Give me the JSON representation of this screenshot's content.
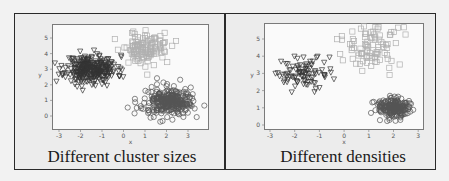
{
  "figure": {
    "panels": [
      {
        "caption": "Different cluster sizes",
        "xlabel": "x",
        "ylabel": "y"
      },
      {
        "caption": "Different densities",
        "xlabel": "x",
        "ylabel": "y"
      }
    ]
  },
  "chart_data": [
    {
      "type": "scatter",
      "title": "Different cluster sizes",
      "xlabel": "x",
      "ylabel": "y",
      "xlim": [
        -3.3,
        3.9
      ],
      "ylim": [
        -0.5,
        5.7
      ],
      "xticks": [
        -3,
        -2,
        -1,
        0,
        1,
        2,
        3
      ],
      "yticks": [
        0,
        1,
        2,
        3,
        4,
        5
      ],
      "grid": false,
      "legend": null,
      "series": [
        {
          "name": "cluster-triangles",
          "marker": "triangle-down",
          "color": "#333333",
          "center": [
            -1.5,
            3.0
          ],
          "spread": [
            0.6,
            0.45
          ],
          "count": 300,
          "note": "large dense cluster"
        },
        {
          "name": "cluster-squares",
          "marker": "square",
          "color": "#b0b0b0",
          "center": [
            1.0,
            4.4
          ],
          "spread": [
            0.55,
            0.5
          ],
          "count": 120
        },
        {
          "name": "cluster-circles",
          "marker": "circle",
          "color": "#555555",
          "center": [
            2.1,
            0.9
          ],
          "spread": [
            0.55,
            0.45
          ],
          "count": 300
        }
      ]
    },
    {
      "type": "scatter",
      "title": "Different densities",
      "xlabel": "x",
      "ylabel": "y",
      "xlim": [
        -3.2,
        3.2
      ],
      "ylim": [
        -0.3,
        5.8
      ],
      "xticks": [
        -3,
        -2,
        -1,
        0,
        1,
        2,
        3
      ],
      "yticks": [
        0,
        1,
        2,
        3,
        4,
        5
      ],
      "grid": false,
      "legend": null,
      "series": [
        {
          "name": "cluster-triangles",
          "marker": "triangle-down",
          "color": "#333333",
          "center": [
            -1.6,
            3.0
          ],
          "spread": [
            0.55,
            0.5
          ],
          "count": 90
        },
        {
          "name": "cluster-squares",
          "marker": "square",
          "color": "#b0b0b0",
          "center": [
            1.1,
            4.5
          ],
          "spread": [
            0.7,
            0.6
          ],
          "count": 90,
          "note": "sparse cluster"
        },
        {
          "name": "cluster-circles",
          "marker": "circle",
          "color": "#555555",
          "center": [
            2.0,
            1.0
          ],
          "spread": [
            0.35,
            0.3
          ],
          "count": 200,
          "note": "dense cluster"
        }
      ]
    }
  ]
}
